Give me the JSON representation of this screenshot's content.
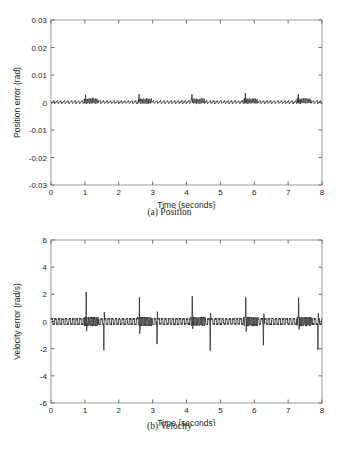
{
  "figure": {
    "background": "#ffffff",
    "trace_color": "#2b2b2b",
    "frame_color": "#9a9a9a"
  },
  "panel_a": {
    "caption": "(a) Position",
    "xlabel": "Time (seconds)",
    "ylabel": "Position error (rad)"
  },
  "panel_b": {
    "caption": "(b) Velocity",
    "xlabel": "Time (seconds)",
    "ylabel": "Velocity error (rad/s)"
  },
  "footer": {
    "text": "cropped caption text partially visible at page bottom"
  },
  "chart_data": [
    {
      "type": "line",
      "id": "position-error",
      "title": "(a) Position",
      "xlabel": "Time (seconds)",
      "ylabel": "Position error (rad)",
      "xlim": [
        0,
        8
      ],
      "ylim": [
        -0.03,
        0.03
      ],
      "xticks": [
        0,
        1,
        2,
        3,
        4,
        5,
        6,
        7,
        8
      ],
      "xticklabels": [
        "0",
        "1",
        "2",
        "3",
        "4",
        "5",
        "6",
        "7",
        "8"
      ],
      "yticks": [
        -0.03,
        -0.02,
        -0.01,
        0,
        0.01,
        0.02,
        0.03
      ],
      "yticklabels": [
        "-0.03",
        "-0.02",
        "-0.01",
        "0",
        "0.01",
        "0.02",
        "0.03"
      ],
      "grid": false,
      "legend": false,
      "series": [
        {
          "name": "position error",
          "description": "Dense sawtooth ripple centered slightly below zero with periodic high-frequency burst clusters and taller spikes near t = 1.0, 2.6, 4.15, 5.75, 7.3 s.",
          "baseline": -0.0004,
          "ripple_amplitude": 0.0011,
          "ripple_period_s": 0.105,
          "burst_period_s": 1.57,
          "burst_width_s": 0.42,
          "burst_ripple_amplitude": 0.0019,
          "spike_times": [
            1.02,
            2.6,
            4.16,
            5.74,
            7.3
          ],
          "spike_values": [
            0.0028,
            0.0031,
            0.003,
            0.0034,
            0.003
          ],
          "y_min_observed": -0.0018,
          "y_max_observed": 0.0034
        }
      ]
    },
    {
      "type": "line",
      "id": "velocity-error",
      "title": "(b) Velocity",
      "xlabel": "Time (seconds)",
      "ylabel": "Velocity error (rad/s)",
      "xlim": [
        0,
        8
      ],
      "ylim": [
        -6,
        6
      ],
      "xticks": [
        0,
        1,
        2,
        3,
        4,
        5,
        6,
        7,
        8
      ],
      "xticklabels": [
        "0",
        "1",
        "2",
        "3",
        "4",
        "5",
        "6",
        "7",
        "8"
      ],
      "yticks": [
        -6,
        -4,
        -2,
        0,
        2,
        4,
        6
      ],
      "yticklabels": [
        "-6",
        "-4",
        "-2",
        "0",
        "2",
        "4",
        "6"
      ],
      "grid": false,
      "legend": false,
      "series": [
        {
          "name": "velocity error",
          "description": "Near-zero dense ripple with alternating large positive and negative impulse spikes, roughly ±2.2 rad/s, repeating about every 1.57 s.",
          "baseline": 0.0,
          "ripple_amplitude": 0.22,
          "ripple_period_s": 0.105,
          "burst_period_s": 1.57,
          "burst_width_s": 0.42,
          "burst_ripple_amplitude": 0.3,
          "positive_spike_times": [
            1.04,
            2.61,
            4.17,
            5.75,
            7.31
          ],
          "positive_spike_values": [
            2.18,
            2.22,
            2.32,
            2.22,
            2.2
          ],
          "positive_spike_undershoot": [
            -0.8,
            -0.9,
            -0.72,
            -1.0,
            -0.78
          ],
          "negative_spike_times": [
            1.56,
            3.13,
            4.7,
            6.27,
            7.88
          ],
          "negative_spike_values": [
            -2.12,
            -2.08,
            -2.15,
            -2.18,
            -2.1
          ],
          "negative_spike_overshoot": [
            0.78,
            0.72,
            0.7,
            0.76,
            0.7
          ],
          "y_min_observed": -2.18,
          "y_max_observed": 2.32
        }
      ]
    }
  ]
}
